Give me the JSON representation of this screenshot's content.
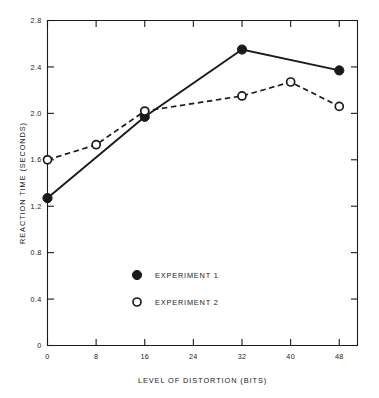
{
  "chart_data": {
    "type": "line",
    "title": "",
    "xlabel": "LEVEL OF DISTORTION (BITS)",
    "ylabel": "REACTION TIME (SECONDS)",
    "xlim": [
      0,
      51
    ],
    "ylim": [
      0,
      2.8
    ],
    "grid": false,
    "legend_position": "center-bottom-inside",
    "xticks": [
      0,
      8,
      16,
      24,
      32,
      40,
      48
    ],
    "xticklabels": [
      "0",
      "8",
      "16",
      "24",
      "32",
      "40",
      "48"
    ],
    "yticks": [
      0,
      0.4,
      0.8,
      1.2,
      1.6,
      2.0,
      2.4,
      2.8
    ],
    "yticklabels": [
      "0",
      "0.4",
      "0.8",
      "1.2",
      "1.6",
      "2.0",
      "2.4",
      "2.8"
    ],
    "series": [
      {
        "name": "EXPERIMENT 1",
        "marker": "filled-circle",
        "linestyle": "solid",
        "color": "#1a1a1a",
        "x": [
          0,
          16,
          32,
          48
        ],
        "values": [
          1.27,
          1.97,
          2.55,
          2.37
        ]
      },
      {
        "name": "EXPERIMENT 2",
        "marker": "open-circle",
        "linestyle": "dashed",
        "color": "#1a1a1a",
        "x": [
          0,
          8,
          16,
          32,
          40,
          48
        ],
        "values": [
          1.6,
          1.73,
          2.02,
          2.15,
          2.27,
          2.06
        ]
      }
    ]
  },
  "legend": {
    "items": [
      {
        "label": "EXPERIMENT 1",
        "marker": "filled-circle"
      },
      {
        "label": "EXPERIMENT 2",
        "marker": "open-circle"
      }
    ]
  },
  "axes": {
    "x_title": "LEVEL OF DISTORTION (BITS)",
    "y_title": "REACTION TIME (SECONDS)"
  }
}
